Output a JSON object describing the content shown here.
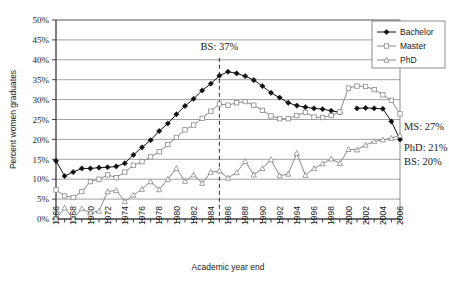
{
  "chart_data": {
    "type": "line",
    "title": "",
    "xlabel": "Academic year end",
    "ylabel": "Percent women graduates",
    "xlim": [
      1966,
      2006
    ],
    "ylim": [
      0,
      50
    ],
    "ytick_labels": [
      "0%",
      "5%",
      "10%",
      "15%",
      "20%",
      "25%",
      "30%",
      "35%",
      "40%",
      "45%",
      "50%"
    ],
    "ytick_values": [
      0,
      5,
      10,
      15,
      20,
      25,
      30,
      35,
      40,
      45,
      50
    ],
    "xtick_labels": [
      "1966",
      "1968",
      "1970",
      "1972",
      "1974",
      "1976",
      "1978",
      "1980",
      "1982",
      "1984",
      "1986",
      "1988",
      "1990",
      "1992",
      "1994",
      "1996",
      "1998",
      "2000",
      "2002",
      "2004",
      "2006"
    ],
    "grid": "horizontal",
    "legend_position": "top-right",
    "x": [
      1966,
      1967,
      1968,
      1969,
      1970,
      1971,
      1972,
      1973,
      1974,
      1975,
      1976,
      1977,
      1978,
      1979,
      1980,
      1981,
      1982,
      1983,
      1984,
      1985,
      1986,
      1987,
      1988,
      1989,
      1990,
      1991,
      1992,
      1993,
      1994,
      1995,
      1996,
      1997,
      1998,
      1999,
      2000,
      2001,
      2002,
      2003,
      2004,
      2005,
      2006
    ],
    "series": [
      {
        "name": "Bachelor",
        "marker": "filled-diamond",
        "color": "#111111",
        "values": [
          14.6,
          10.8,
          11.8,
          12.7,
          12.7,
          12.9,
          13.0,
          13.2,
          14.0,
          16.1,
          18.0,
          19.8,
          22.1,
          24.0,
          26.3,
          28.4,
          30.2,
          32.3,
          34.0,
          36.0,
          37.0,
          36.6,
          35.9,
          34.9,
          33.4,
          31.7,
          30.5,
          29.2,
          28.5,
          28.1,
          27.8,
          27.6,
          27.2,
          26.8,
          null,
          27.8,
          27.9,
          27.8,
          27.7,
          24.5,
          20.0
        ]
      },
      {
        "name": "Master",
        "marker": "open-square",
        "color": "#8a8a8a",
        "values": [
          7.3,
          5.8,
          5.4,
          6.9,
          9.4,
          10.0,
          11.1,
          10.4,
          11.8,
          13.5,
          14.4,
          15.6,
          16.9,
          18.7,
          20.5,
          22.4,
          23.6,
          25.3,
          27.1,
          28.9,
          28.6,
          29.2,
          29.5,
          28.6,
          27.3,
          25.9,
          25.2,
          25.2,
          26.0,
          26.8,
          25.6,
          25.5,
          26.0,
          26.9,
          32.9,
          33.4,
          33.3,
          32.5,
          31.2,
          29.8,
          26.4
        ]
      },
      {
        "name": "PhD",
        "marker": "open-triangle",
        "color": "#8a8a8a",
        "values": [
          0.0,
          2.8,
          0.0,
          2.6,
          1.6,
          2.0,
          6.9,
          7.2,
          4.4,
          6.0,
          7.5,
          9.4,
          7.4,
          10.0,
          12.7,
          9.5,
          11.1,
          9.0,
          11.8,
          12.1,
          10.3,
          11.7,
          14.5,
          11.1,
          12.7,
          14.9,
          10.9,
          11.3,
          16.5,
          11.0,
          12.7,
          13.9,
          15.1,
          14.0,
          17.5,
          17.4,
          18.6,
          19.5,
          19.9,
          20.3,
          21.0
        ]
      }
    ],
    "annotations": [
      {
        "name": "bs-peak-annotation",
        "text": "BS: 37%",
        "x": 1985,
        "y": 42.5
      },
      {
        "name": "ms-end-annotation",
        "text": "MS: 27%"
      },
      {
        "name": "phd-end-annotation",
        "text": "PhD: 21%"
      },
      {
        "name": "bs-end-annotation",
        "text": "BS: 20%"
      }
    ],
    "reference_line": {
      "name": "peak-year-dashed-line",
      "x": 1985
    }
  },
  "legend": {
    "items": [
      {
        "label": "Bachelor",
        "marker": "filled-diamond"
      },
      {
        "label": "Master",
        "marker": "open-square"
      },
      {
        "label": "PhD",
        "marker": "open-triangle"
      }
    ]
  }
}
